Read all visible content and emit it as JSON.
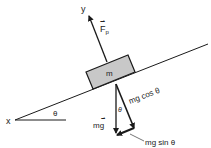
{
  "diagram": {
    "title": "",
    "labels": {
      "x_axis": "x",
      "y_axis": "y",
      "incline_angle": "θ",
      "mass": "m",
      "normal_force": "F",
      "normal_force_subscript": "p",
      "weight": "mg",
      "weight_parallel_component": "mg sin θ",
      "weight_perpendicular_component": "mg cos θ",
      "angle_between_weight_and_perp": "θ"
    },
    "colors": {
      "line": "#1a1a1a",
      "block_fill": "#c8c8c8",
      "background": "#ffffff"
    }
  }
}
